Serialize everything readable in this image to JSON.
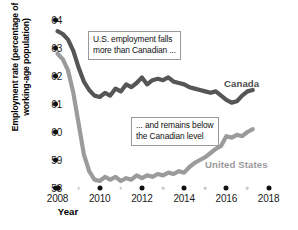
{
  "chart_data": {
    "type": "line",
    "title": "",
    "xlabel": "Year",
    "ylabel": "Employment rate (percentage of working-age population)",
    "xlim": [
      2008,
      2018.4
    ],
    "ylim": [
      58,
      64
    ],
    "grid": false,
    "legend_position": "inline-series-labels",
    "xticks": [
      2008,
      2010,
      2012,
      2014,
      2016,
      2018
    ],
    "xtick_labels": [
      "2008",
      "2010",
      "2012",
      "2014",
      "2016",
      "2018"
    ],
    "xminorticks": [
      2009,
      2011,
      2013,
      2015,
      2017
    ],
    "yticks": [
      58,
      59,
      60,
      61,
      62,
      63,
      64
    ],
    "ytick_labels": [
      "58",
      "59",
      "60",
      "61",
      "62",
      "63",
      "64"
    ],
    "series": [
      {
        "name": "Canada",
        "color": "#565656",
        "x": [
          2008.0,
          2008.25,
          2008.5,
          2008.75,
          2009.0,
          2009.25,
          2009.5,
          2009.75,
          2010.0,
          2010.25,
          2010.5,
          2010.75,
          2011.0,
          2011.25,
          2011.5,
          2011.75,
          2012.0,
          2012.25,
          2012.5,
          2012.75,
          2013.0,
          2013.25,
          2013.5,
          2013.75,
          2014.0,
          2014.25,
          2014.5,
          2014.75,
          2015.0,
          2015.25,
          2015.5,
          2015.75,
          2016.0,
          2016.25,
          2016.5,
          2016.75,
          2017.0,
          2017.25
        ],
        "values": [
          63.6,
          63.5,
          63.3,
          62.9,
          62.3,
          61.8,
          61.5,
          61.3,
          61.25,
          61.4,
          61.3,
          61.55,
          61.45,
          61.7,
          61.6,
          61.75,
          61.95,
          61.7,
          61.85,
          61.9,
          61.85,
          61.95,
          61.8,
          61.75,
          61.7,
          61.6,
          61.55,
          61.5,
          61.45,
          61.4,
          61.45,
          61.3,
          61.15,
          61.05,
          61.1,
          61.3,
          61.45,
          61.5
        ]
      },
      {
        "name": "United States",
        "color": "#9b9b9b",
        "x": [
          2008.0,
          2008.25,
          2008.5,
          2008.75,
          2009.0,
          2009.25,
          2009.5,
          2009.75,
          2010.0,
          2010.25,
          2010.5,
          2010.75,
          2011.0,
          2011.25,
          2011.5,
          2011.75,
          2012.0,
          2012.25,
          2012.5,
          2012.75,
          2013.0,
          2013.25,
          2013.5,
          2013.75,
          2014.0,
          2014.25,
          2014.5,
          2014.75,
          2015.0,
          2015.25,
          2015.5,
          2015.75,
          2016.0,
          2016.25,
          2016.5,
          2016.75,
          2017.0,
          2017.25
        ],
        "values": [
          62.8,
          62.6,
          62.2,
          61.4,
          60.3,
          59.2,
          58.6,
          58.3,
          58.25,
          58.4,
          58.3,
          58.4,
          58.25,
          58.35,
          58.3,
          58.45,
          58.35,
          58.45,
          58.4,
          58.5,
          58.45,
          58.55,
          58.5,
          58.6,
          58.55,
          58.75,
          58.9,
          59.0,
          59.1,
          59.25,
          59.4,
          59.5,
          59.85,
          59.8,
          59.9,
          59.85,
          60.0,
          60.1
        ]
      }
    ],
    "annotations": [
      {
        "id": "callout-1",
        "lines": [
          "U.S. employment falls",
          "more than Canadian ..."
        ]
      },
      {
        "id": "callout-2",
        "lines": [
          "... and remains below",
          "the Canadian level"
        ]
      }
    ]
  },
  "axes": {
    "ylabel": "Employment rate (percentage of working-age population)",
    "xlabel": "Year"
  },
  "series_labels": {
    "canada": "Canada",
    "united_states": "United States"
  },
  "annotations": {
    "callout_1_line_1": "U.S. employment falls",
    "callout_1_line_2": "more than Canadian ...",
    "callout_2_line_1": "... and remains below",
    "callout_2_line_2": "the Canadian level"
  },
  "colors": {
    "canada": "#565656",
    "united_states": "#9b9b9b",
    "tick": "#111111",
    "background": "#ffffff"
  }
}
